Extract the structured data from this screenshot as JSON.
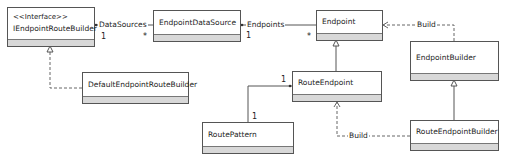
{
  "diagram": {
    "type": "uml-class-diagram",
    "classes": [
      {
        "id": "IEndpointRouteBuilder",
        "stereotype": "<<Interface>>",
        "name": "IEndpointRouteBuilder"
      },
      {
        "id": "EndpointDataSource",
        "name": "EndpointDataSource"
      },
      {
        "id": "Endpoint",
        "name": "Endpoint"
      },
      {
        "id": "EndpointBuilder",
        "name": "EndpointBuilder"
      },
      {
        "id": "DefaultEndpointRouteBuilder",
        "name": "DefaultEndpointRouteBuilder"
      },
      {
        "id": "RouteEndpoint",
        "name": "RouteEndpoint"
      },
      {
        "id": "RoutePattern",
        "name": "RoutePattern"
      },
      {
        "id": "RouteEndpointBuilder",
        "name": "RouteEndpointBuilder"
      }
    ],
    "relations": [
      {
        "from": "IEndpointRouteBuilder",
        "to": "EndpointDataSource",
        "kind": "association",
        "label": "DataSources",
        "from_mult": "1",
        "to_mult": "*"
      },
      {
        "from": "EndpointDataSource",
        "to": "Endpoint",
        "kind": "association",
        "label": "Endpoints",
        "from_mult": "1",
        "to_mult": "*"
      },
      {
        "from": "EndpointBuilder",
        "to": "Endpoint",
        "kind": "dependency",
        "label": "Build"
      },
      {
        "from": "DefaultEndpointRouteBuilder",
        "to": "IEndpointRouteBuilder",
        "kind": "realization"
      },
      {
        "from": "RouteEndpoint",
        "to": "Endpoint",
        "kind": "generalization"
      },
      {
        "from": "RouteEndpointBuilder",
        "to": "EndpointBuilder",
        "kind": "generalization"
      },
      {
        "from": "RouteEndpointBuilder",
        "to": "RouteEndpoint",
        "kind": "dependency",
        "label": "Build"
      },
      {
        "from": "RoutePattern",
        "to": "RouteEndpoint",
        "kind": "association",
        "from_mult": "1",
        "to_mult": "1"
      }
    ]
  },
  "labels": {
    "data_sources": "DataSources",
    "endpoints": "Endpoints",
    "build_top": "Build",
    "build_bottom": "Build",
    "m_ds_one": "1",
    "m_ds_many": "*",
    "m_ep_one": "1",
    "m_ep_many": "*",
    "m_rp_top": "1",
    "m_rp_bottom": "1"
  }
}
